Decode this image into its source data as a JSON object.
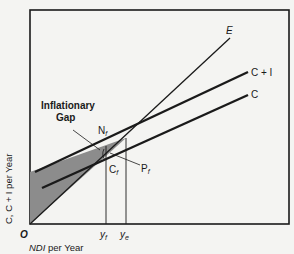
{
  "diagram": {
    "lines": {
      "E": "E",
      "CI": "C + I",
      "C": "C"
    },
    "annotations": {
      "gap_line1": "Inflationary",
      "gap_line2": "Gap",
      "Nf": "N",
      "Nf_sub": "f",
      "Cf": "C",
      "Cf_sub": "f",
      "Pf": "P",
      "Pf_sub": "f"
    },
    "axes": {
      "origin": "O",
      "ylabel": "C, C + I per Year",
      "xlabel_main": "NDI",
      "xlabel_rest": " per Year",
      "yf": "y",
      "yf_sub": "f",
      "ye": "y",
      "ye_sub": "e"
    },
    "colors": {
      "line": "#1a1a1a",
      "shade": "#8c8c8c",
      "background": "#f4f4f2"
    }
  }
}
